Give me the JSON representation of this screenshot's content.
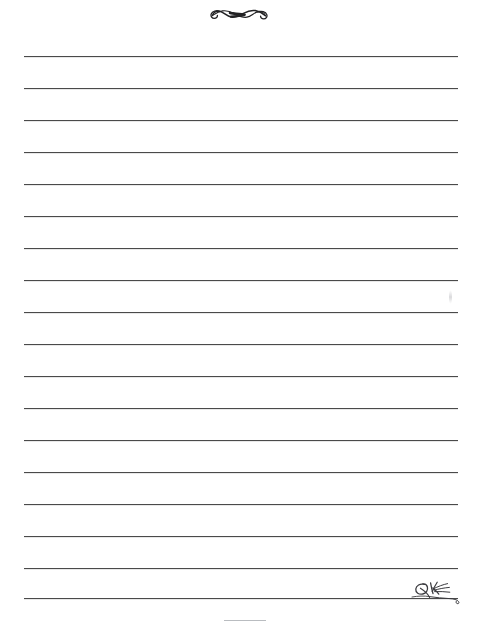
{
  "document": {
    "kind": "lined-stationery-sheet",
    "title": "Blank Lined Writing Paper",
    "background_color": "#ffffff",
    "width_px": 477,
    "height_px": 623
  },
  "ornament": {
    "name": "flourish-divider-ornament",
    "description": "Calligraphic interlocking swash flourish centered at top of page",
    "color": "#222224",
    "center_x_px": 240,
    "center_y_px": 13,
    "width_px": 56,
    "height_px": 20
  },
  "ruled_lines": {
    "count": 18,
    "color": "#4a4a4a",
    "thickness_px": 1,
    "left_margin_px": 24,
    "right_edge_px": 458,
    "line_length_px": 434,
    "first_line_y_px": 56,
    "spacing_px": 32,
    "y_positions": [
      56,
      88,
      120,
      152,
      184,
      216,
      248,
      280,
      312,
      344,
      376,
      408,
      440,
      472,
      504,
      536,
      568,
      598
    ],
    "content": [
      "",
      "",
      "",
      "",
      "",
      "",
      "",
      "",
      "",
      "",
      "",
      "",
      "",
      "",
      "",
      "",
      "",
      ""
    ]
  },
  "signature": {
    "name": "handwritten-signature-flourish",
    "description": "Small handwritten initials with trailing swash resting on the final ruled line",
    "color": "#3c3c40",
    "x_px": 410,
    "y_px": 576,
    "width_px": 56,
    "height_px": 30
  },
  "footer_mark": {
    "name": "faint-footer-tick",
    "color": "#b9bcc0",
    "x_px": 224,
    "y_px": 620,
    "width_px": 42
  }
}
